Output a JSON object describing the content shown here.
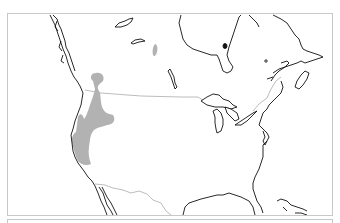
{
  "map": {
    "type": "species-range-map",
    "region": "North America",
    "colors": {
      "background": "#ffffff",
      "coastline": "#111111",
      "political_border": "#b4b4b4",
      "range_fill": "#b2b2b2",
      "frame_border": "#c8c8c8"
    },
    "features": [
      {
        "name": "coastline",
        "style": "black outline"
      },
      {
        "name": "canada-us-border",
        "style": "light gray line"
      },
      {
        "name": "us-mexico-border",
        "style": "light gray line"
      },
      {
        "name": "distribution-range-primary",
        "style": "gray fill",
        "location": "western US / southern British Columbia, Oregon, Idaho, Nevada, California"
      },
      {
        "name": "distribution-range-isolated",
        "style": "gray fill",
        "location": "northern Canada (small patch)"
      }
    ]
  }
}
